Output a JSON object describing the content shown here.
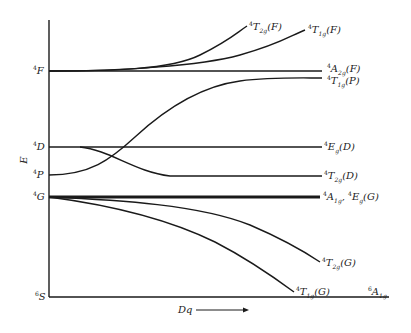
{
  "diagram": {
    "type": "energy-level correlation diagram",
    "y_axis_label": "E",
    "x_axis_label": "Dq",
    "free_ion_terms": [
      {
        "id": "4F",
        "mult": "4",
        "letter": "F"
      },
      {
        "id": "4D",
        "mult": "4",
        "letter": "D"
      },
      {
        "id": "4P",
        "mult": "4",
        "letter": "P"
      },
      {
        "id": "4G",
        "mult": "4",
        "letter": "G"
      },
      {
        "id": "6S",
        "mult": "6",
        "letter": "S"
      }
    ],
    "states": [
      {
        "mult": "4",
        "sym": "T",
        "sub": "2g",
        "term": "(F)"
      },
      {
        "mult": "4",
        "sym": "T",
        "sub": "1g",
        "term": "(F)"
      },
      {
        "mult": "4",
        "sym": "A",
        "sub": "2g",
        "term": "(F)"
      },
      {
        "mult": "4",
        "sym": "T",
        "sub": "1g",
        "term": "(P)"
      },
      {
        "mult": "4",
        "sym": "E",
        "sub": "g",
        "term": "(D)"
      },
      {
        "mult": "4",
        "sym": "T",
        "sub": "2g",
        "term": "(D)"
      },
      {
        "mult": "4",
        "sym": "A",
        "sub": "1g",
        "term": ", ",
        "mult2": "4",
        "sym2": "E",
        "sub2": "g",
        "term2": "(G)"
      },
      {
        "mult": "4",
        "sym": "T",
        "sub": "2g",
        "term": "(G)"
      },
      {
        "mult": "4",
        "sym": "T",
        "sub": "1g",
        "term": "(G)"
      },
      {
        "mult": "6",
        "sym": "A",
        "sub": "1g",
        "term": ""
      }
    ]
  }
}
